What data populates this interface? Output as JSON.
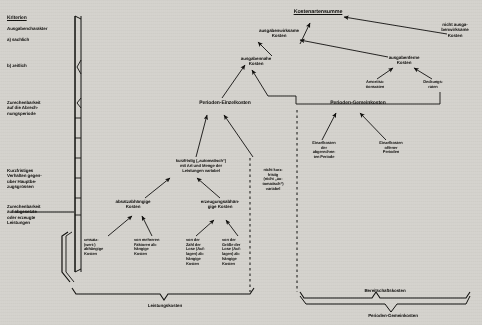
{
  "document": {
    "type": "cost-accounting-hierarchy-diagram",
    "language": "de",
    "background_color": "#cfcdc8",
    "ink_color": "#11100e"
  },
  "criteria_column": {
    "heading": "Kriterien",
    "items": [
      {
        "id": "ausgabencharakter",
        "label": "Ausgabencharakter"
      },
      {
        "id": "sachlich",
        "label": "a) sachlich"
      },
      {
        "id": "zeitlich",
        "label": "b) zeitlich"
      },
      {
        "id": "zurechenbarkeit-periode",
        "label": "Zurechenbarkeit\nauf die Abrech-\nnungsperiode"
      },
      {
        "id": "kurzfristiges-verhalten",
        "label": "Kurzfristiges\nVerhalten gegen-\nüber Hauptbe-\nzugsgrössen"
      },
      {
        "id": "zurechenbarkeit-leistungen",
        "label": "Zurechenbarkeit\nauf abgesetzte\noder erzeugte\nLeistungen"
      }
    ]
  },
  "nodes": {
    "kostenartensumme": {
      "label": "Kostenartensumme"
    },
    "ausgabenwirksame": {
      "label": "ausgabenwirksame\nKosten"
    },
    "nicht_ausgabenwirksame": {
      "label": "nicht ausga-\nbenwirksame\nKosten"
    },
    "ausgabennahe": {
      "label": "ausgabennahe\nKosten"
    },
    "ausgabenferne": {
      "label": "ausgabenferne\nKosten"
    },
    "amortisationsraten": {
      "label": "Amortisa-\ntionsraten"
    },
    "deckungsraten": {
      "label": "Deckungs-\nraten"
    },
    "perioden_einzelkosten": {
      "label": "Perioden-Einzelkosten"
    },
    "perioden_gemeinkosten": {
      "label": "Perioden-Gemeinkosten"
    },
    "einzelkosten_abgerechnete": {
      "label": "Einzelkosten\nder\nabgerechne-\nten Periode"
    },
    "einzelkosten_offener": {
      "label": "Einzelkosten\noffener\nPerioden"
    },
    "kurzfristig_variabel": {
      "label": "kurzfristig („automatisch“)\nmit Art und Menge der\nLeistungen variabel"
    },
    "nicht_kurzfristig_variabel": {
      "label": "nicht kurz-\nfristig\n(nicht „au-\ntomatisch“)\nvariabel"
    },
    "absatzabhaengige": {
      "label": "absatzabhängige\nKosten"
    },
    "erzeugungsabhaengige": {
      "label": "erzeugungsabhän-\ngige Kosten"
    },
    "umsatzabhaengige": {
      "label": "umsatz-\n(wert-)\nabhängige\nKosten"
    },
    "mehrere_faktoren": {
      "label": "von mehreren\nFaktoren ab-\nhängige\nKosten"
    },
    "zahl_der_lose": {
      "label": "von der\nZahl der\nLose (Auf-\nlagen) ab-\nhängige\nKosten"
    },
    "groesse_der_lose": {
      "label": "von der\nGröße der\nLose (Auf-\nlagen) ab-\nhängige\nKosten"
    }
  },
  "brackets": {
    "leistungskosten": {
      "label": "Leistungskosten"
    },
    "bereitschaftskosten": {
      "label": "Bereitschaftskosten"
    },
    "perioden_gemeinkosten_bracket": {
      "label": "Perioden-Gemeinkosten"
    }
  }
}
